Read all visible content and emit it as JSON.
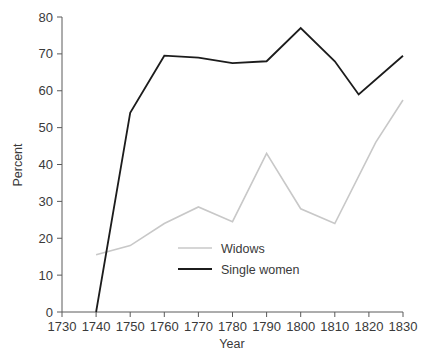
{
  "chart_data": {
    "type": "line",
    "title": "",
    "subtitle": "",
    "xlabel": "Year",
    "ylabel": "Percent",
    "xlim": [
      1730,
      1830
    ],
    "ylim": [
      0,
      80
    ],
    "grid": false,
    "legend_position": "inside-center-lower",
    "x_ticks": [
      1730,
      1740,
      1750,
      1760,
      1770,
      1780,
      1790,
      1800,
      1810,
      1820,
      1830
    ],
    "x_tick_labels": [
      "1730",
      "1740",
      "1750",
      "1760",
      "1770",
      "1780",
      "1790",
      "1800",
      "1810",
      "1820",
      "1830"
    ],
    "y_ticks": [
      0,
      10,
      20,
      30,
      40,
      50,
      60,
      70,
      80
    ],
    "y_tick_labels": [
      "0",
      "10",
      "20",
      "30",
      "40",
      "50",
      "60",
      "70",
      "80"
    ],
    "series": [
      {
        "name": "Widows",
        "color": "#c8c8c8",
        "stroke_width": 1.6,
        "x": [
          1740,
          1750,
          1760,
          1770,
          1780,
          1790,
          1800,
          1810,
          1822,
          1830
        ],
        "values": [
          15.5,
          18.0,
          24.0,
          28.5,
          24.5,
          43.0,
          28.0,
          24.0,
          46.0,
          57.5
        ]
      },
      {
        "name": "Single women",
        "color": "#1c1c1c",
        "stroke_width": 1.8,
        "x": [
          1740,
          1750,
          1760,
          1770,
          1780,
          1790,
          1800,
          1810,
          1817,
          1830
        ],
        "values": [
          0.0,
          54.0,
          69.5,
          69.0,
          67.5,
          68.0,
          77.0,
          68.0,
          59.0,
          69.5
        ]
      }
    ]
  },
  "legend": {
    "entries": [
      {
        "label": "Widows",
        "color": "#c8c8c8"
      },
      {
        "label": "Single women",
        "color": "#1c1c1c"
      }
    ]
  },
  "caption": {
    "text": ""
  }
}
